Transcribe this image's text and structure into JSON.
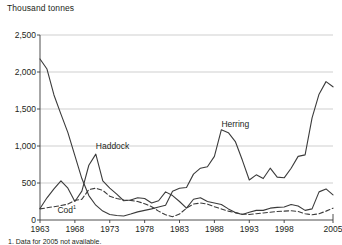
{
  "axis_title": "Thousand tonnes",
  "footnote": "1. Data for 2005 not available.",
  "colors": {
    "line": "#3b3b3b",
    "grid": "#c9c9c9",
    "axis": "#3b3b3b",
    "text": "#231f20"
  },
  "labels": {
    "herring": "Herring",
    "haddock": "Haddock",
    "cod": "Cod",
    "cod_footnote_marker": "1"
  },
  "chart_data": {
    "type": "line",
    "title": "",
    "subtitle": "",
    "xlabel": "",
    "ylabel": "Thousand tonnes",
    "xlim": [
      1963,
      2005
    ],
    "ylim": [
      0,
      2500
    ],
    "ytick_labels": [
      "0",
      "500",
      "1,000",
      "1,500",
      "2,000",
      "2,500"
    ],
    "ytick_values": [
      0,
      500,
      1000,
      1500,
      2000,
      2500
    ],
    "xtick_labels": [
      "1963",
      "1968",
      "1973",
      "1978",
      "1983",
      "1988",
      "1993",
      "1998",
      "2005"
    ],
    "xtick_values": [
      1963,
      1968,
      1973,
      1978,
      1983,
      1988,
      1993,
      1998,
      2005
    ],
    "grid": true,
    "legend": "inline-annotations",
    "x": [
      1963,
      1964,
      1965,
      1966,
      1967,
      1968,
      1969,
      1970,
      1971,
      1972,
      1973,
      1974,
      1975,
      1976,
      1977,
      1978,
      1979,
      1980,
      1981,
      1982,
      1983,
      1984,
      1985,
      1986,
      1987,
      1988,
      1989,
      1990,
      1991,
      1992,
      1993,
      1994,
      1995,
      1996,
      1997,
      1998,
      1999,
      2000,
      2001,
      2002,
      2003,
      2004,
      2005
    ],
    "series": [
      {
        "name": "Herring",
        "style": "solid",
        "values": [
          2175,
          2040,
          1690,
          1430,
          1180,
          870,
          560,
          330,
          200,
          120,
          75,
          60,
          55,
          80,
          110,
          130,
          150,
          175,
          200,
          390,
          430,
          440,
          620,
          700,
          720,
          860,
          1220,
          1180,
          1060,
          810,
          540,
          610,
          560,
          700,
          580,
          570,
          700,
          860,
          880,
          1380,
          1700,
          1870,
          1800
        ]
      },
      {
        "name": "Haddock",
        "style": "solid",
        "values": [
          155,
          300,
          420,
          530,
          430,
          250,
          390,
          740,
          890,
          530,
          430,
          350,
          260,
          270,
          300,
          290,
          230,
          260,
          380,
          330,
          250,
          160,
          280,
          300,
          250,
          230,
          210,
          150,
          100,
          75,
          105,
          130,
          130,
          160,
          170,
          175,
          210,
          190,
          130,
          150,
          380,
          420,
          340
        ]
      },
      {
        "name": "Cod",
        "style": "dashed",
        "values": [
          150,
          165,
          180,
          195,
          215,
          265,
          280,
          410,
          430,
          400,
          320,
          290,
          270,
          265,
          250,
          220,
          180,
          120,
          70,
          45,
          80,
          160,
          215,
          230,
          215,
          180,
          150,
          120,
          100,
          80,
          75,
          85,
          95,
          105,
          115,
          120,
          125,
          115,
          85,
          70,
          85,
          120,
          160
        ]
      }
    ],
    "annotations": [
      {
        "text": "Herring",
        "x": 1989,
        "y": 1290
      },
      {
        "text": "Haddock",
        "x": 1971,
        "y": 980
      },
      {
        "text": "Cod",
        "x": 1965.5,
        "y": 130
      }
    ]
  }
}
